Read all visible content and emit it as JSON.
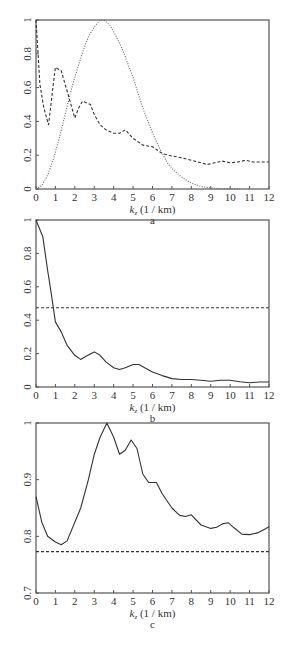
{
  "chart_data": [
    {
      "id": "a",
      "type": "line",
      "caption": "a",
      "xlabel": "k_z (1 / km)",
      "xlabel_main": "k",
      "xlabel_sub": "z",
      "xlabel_rest": " (1 / km)",
      "ylabel": "",
      "xlim": [
        0,
        12
      ],
      "ylim": [
        0,
        1
      ],
      "xticks": [
        "0",
        "1",
        "2",
        "3",
        "4",
        "5",
        "6",
        "7",
        "8",
        "9",
        "10",
        "11",
        "12"
      ],
      "yticks": [
        "0",
        "0.2",
        "0.4",
        "0.6",
        "0.8",
        "1"
      ],
      "grid": false,
      "legend": null,
      "series": [
        {
          "name": "dashed",
          "style": "dashed",
          "x": [
            0,
            0.2,
            0.4,
            0.65,
            0.85,
            1.0,
            1.3,
            1.6,
            1.8,
            2.0,
            2.2,
            2.4,
            2.8,
            3.0,
            3.3,
            3.6,
            4.0,
            4.3,
            4.6,
            5.0,
            5.5,
            6.0,
            6.5,
            7.0,
            7.5,
            8.0,
            8.5,
            8.8,
            9.2,
            9.6,
            10.0,
            10.4,
            10.8,
            11.2,
            11.6,
            12.0
          ],
          "y": [
            1.0,
            0.62,
            0.48,
            0.38,
            0.58,
            0.72,
            0.7,
            0.58,
            0.5,
            0.42,
            0.48,
            0.52,
            0.5,
            0.44,
            0.38,
            0.35,
            0.33,
            0.33,
            0.35,
            0.3,
            0.26,
            0.25,
            0.21,
            0.195,
            0.185,
            0.17,
            0.155,
            0.145,
            0.155,
            0.165,
            0.155,
            0.16,
            0.17,
            0.16,
            0.16,
            0.16
          ]
        },
        {
          "name": "dotted",
          "style": "dotted",
          "x": [
            0,
            0.3,
            0.6,
            0.9,
            1.2,
            1.5,
            1.8,
            2.1,
            2.4,
            2.7,
            3.0,
            3.3,
            3.5,
            3.8,
            4.1,
            4.4,
            4.7,
            5.0,
            5.3,
            5.6,
            5.9,
            6.2,
            6.5,
            6.8,
            7.1,
            7.4,
            7.7,
            8.0,
            8.5,
            9.0,
            9.5,
            10.0,
            10.5
          ],
          "y": [
            0.0,
            0.02,
            0.08,
            0.18,
            0.3,
            0.44,
            0.58,
            0.7,
            0.81,
            0.9,
            0.96,
            1.0,
            1.0,
            0.97,
            0.91,
            0.84,
            0.75,
            0.66,
            0.55,
            0.45,
            0.36,
            0.28,
            0.21,
            0.15,
            0.11,
            0.08,
            0.055,
            0.035,
            0.015,
            0.006,
            0.002,
            0.0,
            0.0
          ]
        }
      ]
    },
    {
      "id": "b",
      "type": "line",
      "caption": "b",
      "xlabel": "k_z (1 / km)",
      "xlabel_main": "k",
      "xlabel_sub": "z",
      "xlabel_rest": " (1 / km)",
      "ylabel": "",
      "xlim": [
        0,
        12
      ],
      "ylim": [
        0,
        1
      ],
      "xticks": [
        "0",
        "1",
        "2",
        "3",
        "4",
        "5",
        "6",
        "7",
        "8",
        "9",
        "10",
        "11",
        "12"
      ],
      "yticks": [
        "0",
        "0.2",
        "0.4",
        "0.6",
        "0.8",
        "1"
      ],
      "grid": false,
      "legend": null,
      "series": [
        {
          "name": "solid",
          "style": "solid",
          "x": [
            0,
            0.35,
            0.6,
            0.8,
            1.0,
            1.3,
            1.6,
            2.0,
            2.3,
            2.6,
            3.0,
            3.3,
            3.6,
            4.0,
            4.3,
            4.6,
            5.0,
            5.3,
            5.6,
            6.0,
            6.5,
            7.0,
            7.5,
            8.0,
            8.5,
            9.0,
            9.5,
            10.0,
            10.5,
            11.0,
            11.5,
            12.0
          ],
          "y": [
            1.0,
            0.9,
            0.7,
            0.55,
            0.39,
            0.33,
            0.25,
            0.19,
            0.165,
            0.185,
            0.21,
            0.19,
            0.15,
            0.115,
            0.105,
            0.115,
            0.135,
            0.135,
            0.115,
            0.09,
            0.068,
            0.05,
            0.045,
            0.045,
            0.04,
            0.035,
            0.04,
            0.04,
            0.032,
            0.025,
            0.03,
            0.03
          ]
        },
        {
          "name": "threshold",
          "style": "dashed",
          "x": [
            0,
            12
          ],
          "y": [
            0.475,
            0.475
          ]
        }
      ]
    },
    {
      "id": "c",
      "type": "line",
      "caption": "c",
      "xlabel": "k_z (1 / km)",
      "xlabel_main": "k",
      "xlabel_sub": "z",
      "xlabel_rest": " (1 / km)",
      "ylabel": "",
      "xlim": [
        0,
        12
      ],
      "ylim": [
        0.7,
        1.0
      ],
      "xticks": [
        "0",
        "1",
        "2",
        "3",
        "4",
        "5",
        "6",
        "7",
        "8",
        "9",
        "10",
        "11",
        "12"
      ],
      "yticks": [
        "0.7",
        "0.8",
        "0.9",
        "1"
      ],
      "grid": false,
      "legend": null,
      "series": [
        {
          "name": "solid",
          "style": "solid",
          "x": [
            0,
            0.3,
            0.6,
            1.0,
            1.3,
            1.6,
            2.0,
            2.3,
            2.7,
            3.0,
            3.3,
            3.65,
            4.0,
            4.3,
            4.6,
            4.9,
            5.2,
            5.5,
            5.8,
            6.2,
            6.5,
            7.0,
            7.4,
            7.7,
            8.0,
            8.5,
            9.0,
            9.3,
            9.6,
            9.9,
            10.2,
            10.6,
            11.0,
            11.4,
            11.8,
            12.0
          ],
          "y": [
            0.87,
            0.825,
            0.8,
            0.79,
            0.785,
            0.792,
            0.825,
            0.85,
            0.9,
            0.945,
            0.975,
            1.0,
            0.975,
            0.945,
            0.952,
            0.97,
            0.955,
            0.91,
            0.895,
            0.895,
            0.875,
            0.85,
            0.837,
            0.835,
            0.838,
            0.82,
            0.814,
            0.816,
            0.822,
            0.824,
            0.815,
            0.804,
            0.803,
            0.806,
            0.813,
            0.817
          ]
        },
        {
          "name": "threshold",
          "style": "dashed",
          "x": [
            0,
            12
          ],
          "y": [
            0.773,
            0.773
          ]
        }
      ]
    }
  ],
  "layout": {
    "plots": [
      {
        "id": "a",
        "left": 36,
        "right": 269,
        "top": 20,
        "bottom": 189
      },
      {
        "id": "b",
        "left": 36,
        "right": 269,
        "top": 220,
        "bottom": 387
      },
      {
        "id": "c",
        "left": 36,
        "right": 269,
        "top": 423,
        "bottom": 593
      }
    ]
  }
}
